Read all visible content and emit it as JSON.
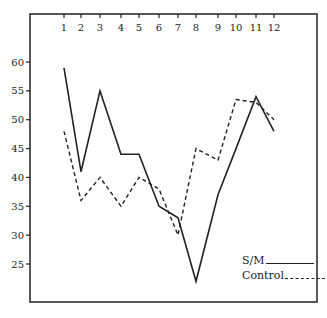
{
  "chart_data": {
    "type": "line",
    "title": "",
    "xlabel": "",
    "ylabel": "",
    "x": [
      1,
      2,
      3,
      4,
      5,
      6,
      7,
      8,
      9,
      10,
      11,
      12
    ],
    "x_tick_labels": [
      "1",
      "2",
      "3",
      "4",
      "5",
      "6",
      "7",
      "8",
      "9",
      "10",
      "11",
      "12"
    ],
    "x_axis_position": "top",
    "y_ticks": [
      60,
      55,
      50,
      45,
      40,
      35,
      30,
      25
    ],
    "y_tick_labels": [
      "60",
      "55",
      "50",
      "45",
      "40",
      "35",
      "30",
      "25"
    ],
    "ylim": [
      18,
      65
    ],
    "grid": false,
    "legend_position": "lower right (inside)",
    "series": [
      {
        "name": "S/M",
        "style": "solid",
        "values": [
          59,
          41,
          55,
          44,
          44,
          35,
          33,
          22,
          37,
          45,
          54,
          48
        ]
      },
      {
        "name": "Control",
        "style": "dashed",
        "values": [
          48,
          36,
          40,
          35,
          40,
          38,
          30,
          45,
          43,
          53.5,
          53,
          50
        ]
      }
    ]
  },
  "legend": {
    "items": [
      {
        "label": "S/M",
        "line": "solid"
      },
      {
        "label": "Control",
        "line": "dashed"
      }
    ]
  },
  "colors": {
    "ink": "#222222",
    "background": "#ffffff"
  }
}
